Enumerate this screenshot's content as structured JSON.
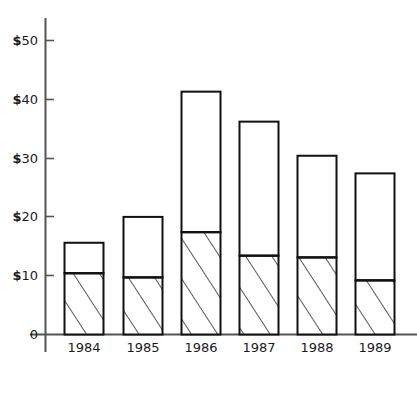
{
  "chart_data": {
    "type": "bar",
    "subtype": "stacked-vertical",
    "title": "",
    "subtitle": "",
    "xlabel": "",
    "ylabel": "",
    "categories": [
      "1984",
      "1985",
      "1986",
      "1987",
      "1988",
      "1989"
    ],
    "series": [
      {
        "name": "hatched-lower-segment",
        "fill": "diagonal-hatch",
        "values": [
          10.4,
          9.7,
          17.4,
          13.4,
          13.1,
          9.2
        ]
      },
      {
        "name": "white-upper-segment",
        "fill": "white",
        "values": [
          5.2,
          10.3,
          23.9,
          22.8,
          17.3,
          18.2
        ]
      }
    ],
    "totals": [
      15.6,
      20.0,
      41.3,
      36.2,
      30.4,
      27.4
    ],
    "ylim": [
      0,
      53
    ],
    "yticks": [
      0,
      10,
      20,
      30,
      40,
      50
    ],
    "ytick_labels": [
      "0",
      "$10",
      "$20",
      "$30",
      "$40",
      "$50"
    ],
    "xtick_labels": [
      "1984",
      "1985",
      "1986",
      "1987",
      "1988",
      "1989"
    ],
    "grid": false,
    "legend": "none",
    "colors": {
      "axis": "#555555",
      "bar_outline": "#111111",
      "bar_fill": "#ffffff",
      "hatch_line": "#111111",
      "text": "#1a1a1a",
      "background": "#ffffff"
    },
    "annotations": []
  },
  "axis": {
    "y_ticks": [
      {
        "label": "$50",
        "currency": "$",
        "number": "50",
        "value": 50
      },
      {
        "label": "$40",
        "currency": "$",
        "number": "40",
        "value": 40
      },
      {
        "label": "$30",
        "currency": "$",
        "number": "30",
        "value": 30
      },
      {
        "label": "$20",
        "currency": "$",
        "number": "20",
        "value": 20
      },
      {
        "label": "$10",
        "currency": "$",
        "number": "10",
        "value": 10
      },
      {
        "label": "0",
        "currency": "",
        "number": "0",
        "value": 0
      }
    ],
    "x_ticks": [
      {
        "label": "1984"
      },
      {
        "label": "1985"
      },
      {
        "label": "1986"
      },
      {
        "label": "1987"
      },
      {
        "label": "1988"
      },
      {
        "label": "1989"
      }
    ]
  }
}
